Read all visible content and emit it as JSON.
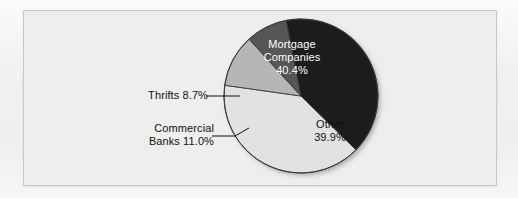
{
  "figure": {
    "background_color": "#eeeeee",
    "frame_border_color": "#c8c8c8"
  },
  "chart_data": {
    "type": "pie",
    "title": "",
    "subtitle": "",
    "xlabel": "",
    "ylabel": "",
    "legend_position": "none",
    "grid": false,
    "units": "percent",
    "total": 100.0,
    "categories": [
      "Mortgage Companies",
      "Other",
      "Commercial Banks",
      "Thrifts"
    ],
    "values": [
      40.4,
      39.9,
      11.0,
      8.7
    ],
    "slices": [
      {
        "name": "Mortgage Companies",
        "label_line1": "Mortgage",
        "label_line2": "Companies",
        "value_text": "40.4%",
        "value": 40.4,
        "color": "#1c1c1c",
        "label_placement": "inside",
        "label_color": "#ffffff",
        "start_angle_deg": 349.0,
        "end_angle_deg": 134.4
      },
      {
        "name": "Other",
        "label_line1": "Other",
        "label_line2": "",
        "value_text": "39.9%",
        "value": 39.9,
        "color": "#e2e2e2",
        "label_placement": "inside",
        "label_color": "#111111",
        "start_angle_deg": 134.4,
        "end_angle_deg": 278.0
      },
      {
        "name": "Commercial Banks",
        "label_line1": "Commercial",
        "label_line2": "Banks 11.0%",
        "value_text": "11.0%",
        "value": 11.0,
        "color": "#b6b6b6",
        "label_placement": "outside",
        "label_color": "#111111",
        "start_angle_deg": 278.0,
        "end_angle_deg": 317.6
      },
      {
        "name": "Thrifts",
        "label_line1": "Thrifts 8.7%",
        "label_line2": "",
        "value_text": "8.7%",
        "value": 8.7,
        "color": "#565656",
        "label_placement": "outside",
        "label_color": "#111111",
        "start_angle_deg": 317.6,
        "end_angle_deg": 349.0
      }
    ],
    "annotations": [
      {
        "name": "thrifts-leader",
        "text": "Thrifts 8.7%"
      },
      {
        "name": "commercial-banks-leader",
        "text": "Commercial\nBanks 11.0%"
      }
    ]
  },
  "labels": {
    "mortgage": "Mortgage\nCompanies\n40.4%",
    "other": "Other\n39.9%",
    "thrifts": "Thrifts 8.7%",
    "commercial": "Commercial\nBanks 11.0%"
  }
}
